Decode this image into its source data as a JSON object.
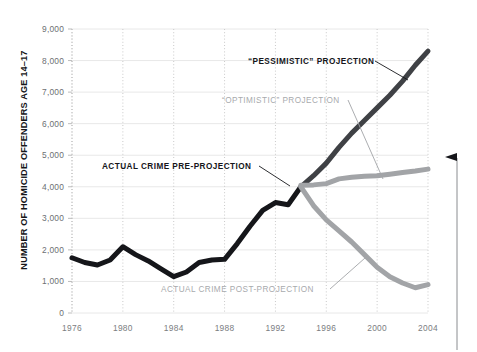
{
  "chart_data": {
    "type": "line",
    "title": "",
    "xlabel": "",
    "ylabel": "NUMBER OF HOMICIDE OFFENDERS AGE 14–17",
    "xlim": [
      1976,
      2004
    ],
    "ylim": [
      0,
      9000
    ],
    "grid": "horizontal solid light + vertical dotted at 4-year ticks",
    "legend_position": "inline annotations with leader lines",
    "y_ticks": [
      "0",
      "1,000",
      "2,000",
      "3,000",
      "4,000",
      "5,000",
      "6,000",
      "7,000",
      "8,000",
      "9,000"
    ],
    "y_tick_values": [
      0,
      1000,
      2000,
      3000,
      4000,
      5000,
      6000,
      7000,
      8000,
      9000
    ],
    "x_ticks": [
      "1976",
      "1980",
      "1984",
      "1988",
      "1992",
      "1996",
      "2000",
      "2004"
    ],
    "x_tick_values": [
      1976,
      1980,
      1984,
      1988,
      1992,
      1996,
      2000,
      2004
    ],
    "colors": {
      "actual_pre": "#15161a",
      "pessimistic": "#3f4145",
      "optimistic": "#a2a4a7",
      "actual_post": "#a2a4a7",
      "gridline": "#e8e8e8",
      "dotted_gridline": "#c9c9c9",
      "axis_text": "#6d6f73"
    },
    "series": [
      {
        "name": "ACTUAL CRIME PRE-PROJECTION",
        "color": "#15161a",
        "style": "solid-thick",
        "x": [
          1976,
          1977,
          1978,
          1979,
          1980,
          1981,
          1982,
          1983,
          1984,
          1985,
          1986,
          1987,
          1988,
          1989,
          1990,
          1991,
          1992,
          1993,
          1994
        ],
        "values": [
          1750,
          1600,
          1520,
          1680,
          2100,
          1850,
          1650,
          1400,
          1150,
          1300,
          1600,
          1680,
          1700,
          2200,
          2750,
          3250,
          3500,
          3430,
          4000
        ]
      },
      {
        "name": "“PESSIMISTIC” PROJECTION",
        "color": "#3f4145",
        "style": "solid-thick",
        "x": [
          1994,
          1995,
          1996,
          1997,
          1998,
          1999,
          2000,
          2001,
          2002,
          2003,
          2004
        ],
        "values": [
          4000,
          4350,
          4750,
          5250,
          5700,
          6100,
          6500,
          6900,
          7350,
          7850,
          8300
        ]
      },
      {
        "name": "“OPTIMISTIC” PROJECTION",
        "color": "#a2a4a7",
        "style": "solid-thick",
        "x": [
          1994,
          1995,
          1996,
          1997,
          1998,
          1999,
          2000,
          2001,
          2002,
          2003,
          2004
        ],
        "values": [
          4050,
          4060,
          4100,
          4250,
          4300,
          4330,
          4350,
          4400,
          4450,
          4500,
          4560
        ]
      },
      {
        "name": "ACTUAL CRIME POST-PROJECTION",
        "color": "#a2a4a7",
        "style": "solid-thick",
        "x": [
          1994,
          1995,
          1996,
          1997,
          1998,
          1999,
          2000,
          2001,
          2002,
          2003,
          2004
        ],
        "values": [
          4000,
          3400,
          2950,
          2600,
          2250,
          1850,
          1450,
          1150,
          950,
          800,
          900
        ]
      }
    ],
    "annotations": [
      {
        "id": "pessimistic",
        "label": "“PESSIMISTIC” PROJECTION",
        "tone": "dark",
        "text_x": 248,
        "text_y": 64,
        "leader": [
          [
            375,
            61
          ],
          [
            408,
            80
          ]
        ]
      },
      {
        "id": "optimistic",
        "label": "“OPTIMISTIC” PROJECTION",
        "tone": "light",
        "text_x": 222,
        "text_y": 103,
        "leader": [
          [
            348,
            100
          ],
          [
            383,
            179
          ]
        ]
      },
      {
        "id": "actual-pre",
        "label": "ACTUAL CRIME PRE-PROJECTION",
        "tone": "dark",
        "text_x": 102,
        "text_y": 169,
        "leader": [
          [
            259,
            166
          ],
          [
            290,
            186
          ]
        ]
      },
      {
        "id": "actual-post",
        "label": "ACTUAL CRIME POST-PROJECTION",
        "tone": "light",
        "text_x": 161,
        "text_y": 292,
        "leader": [
          [
            330,
            289
          ],
          [
            365,
            258
          ]
        ]
      }
    ],
    "right_marker": {
      "name": "right-edge-pointer",
      "description": "thin vertical rule at right margin with a left-pointing arrowhead near the top"
    }
  }
}
